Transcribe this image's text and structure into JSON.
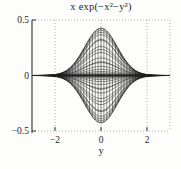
{
  "figure": {
    "title": "x exp(−x²−y²)",
    "xlabel": "y"
  },
  "chart_data": {
    "type": "line",
    "subtype": "3d-mesh-side-projection",
    "title": "x exp(−x²−y²)",
    "formula": "z = x*exp(-x^2-y^2)",
    "projection": "mesh viewed along the x-axis, projected onto the (y,z) plane",
    "curve_rule": "each constant-x mesh line projects to z(y) = x*exp(-x^2)*exp(-y^2); each constant-y mesh line projects to a vertical segment spanning the +/- envelope",
    "x_grid": {
      "min": -3,
      "max": 3,
      "step": 0.125
    },
    "y_grid": {
      "min": -3,
      "max": 3,
      "step": 0.125
    },
    "xlabel": "y",
    "xlim": [
      -3,
      3
    ],
    "zlim": [
      -0.5,
      0.5
    ],
    "xticks": [
      {
        "v": -2,
        "label": "−2"
      },
      {
        "v": 0,
        "label": "0"
      },
      {
        "v": 2,
        "label": "2"
      }
    ],
    "zticks": [
      {
        "v": 0.5,
        "label": "0.5"
      },
      {
        "v": 0,
        "label": "0"
      },
      {
        "v": -0.5,
        "label": "−0.5"
      }
    ],
    "envelope_peak": 0.427,
    "grid_on": true,
    "legend": null,
    "colors": {
      "line": "#1f1f1f",
      "grid_dots": "#979790",
      "axis": "#2e2e2e",
      "text": "#1e1e1e",
      "background": "#fdfdfb"
    }
  }
}
